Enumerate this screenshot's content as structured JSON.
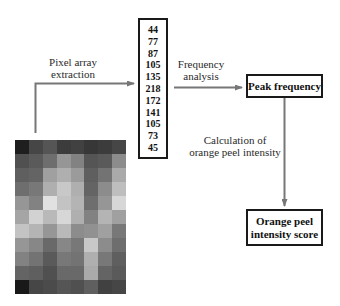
{
  "diagram": {
    "steps": {
      "pixel_array_label": [
        "Pixel array",
        "extraction"
      ],
      "frequency_label": [
        "Frequency",
        "analysis"
      ],
      "calculation_label": [
        "Calculation of",
        "orange peel intensity"
      ]
    },
    "boxes": {
      "peak_frequency": "Peak frequency",
      "score": [
        "Orange peel",
        "intensity score"
      ]
    },
    "pixel_values": [
      "44",
      "77",
      "87",
      "105",
      "135",
      "218",
      "172",
      "141",
      "105",
      "73",
      "45"
    ],
    "pixel_grid": {
      "cols": 8,
      "rows": 11,
      "gray_levels": [
        [
          30,
          70,
          85,
          60,
          65,
          55,
          60,
          70
        ],
        [
          80,
          90,
          110,
          150,
          130,
          85,
          90,
          140
        ],
        [
          95,
          100,
          160,
          175,
          155,
          95,
          115,
          170
        ],
        [
          110,
          120,
          175,
          200,
          175,
          100,
          140,
          190
        ],
        [
          150,
          130,
          225,
          195,
          180,
          110,
          150,
          215
        ],
        [
          165,
          210,
          185,
          215,
          175,
          130,
          180,
          160
        ],
        [
          195,
          180,
          150,
          185,
          140,
          145,
          160,
          120
        ],
        [
          150,
          135,
          105,
          135,
          120,
          200,
          140,
          110
        ],
        [
          130,
          115,
          90,
          120,
          115,
          175,
          120,
          95
        ],
        [
          100,
          95,
          80,
          105,
          105,
          170,
          100,
          90
        ],
        [
          25,
          70,
          75,
          85,
          80,
          95,
          65,
          70
        ]
      ]
    },
    "colors": {
      "arrow": "#777777",
      "box_border": "#1a1a1a"
    }
  }
}
